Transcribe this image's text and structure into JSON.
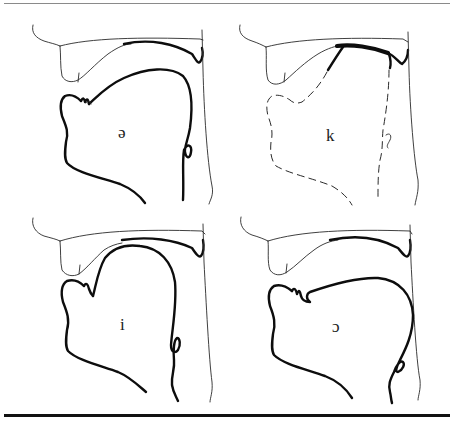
{
  "figure": {
    "panels": [
      {
        "id": "schwa",
        "label": "ə",
        "position": "top-left"
      },
      {
        "id": "k",
        "label": "k",
        "position": "top-right"
      },
      {
        "id": "i",
        "label": "i",
        "position": "bottom-left"
      },
      {
        "id": "open-o",
        "label": "ɔ",
        "position": "bottom-right"
      }
    ],
    "colors": {
      "ink": "#0d0d0d",
      "top_rule": "#8a8a8a",
      "bottom_rule": "#111111",
      "background": "#ffffff"
    }
  }
}
